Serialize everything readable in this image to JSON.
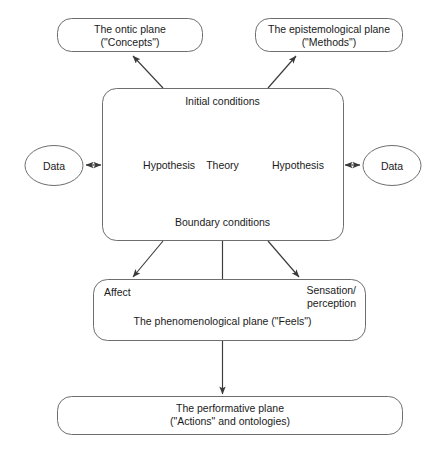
{
  "diagram": {
    "style": {
      "node_fill": "#ffffff",
      "node_stroke": "#6e6e6e",
      "edge_stroke": "#3a3a3a",
      "text_color": "#1a1a1a",
      "background": "#ffffff"
    },
    "nodes": {
      "ontic_plane": {
        "line1": "The ontic plane",
        "line2": "(\"Concepts\")"
      },
      "epistemological_plane": {
        "line1": "The epistemological plane",
        "line2": "(\"Methods\")"
      },
      "initial_conditions": {
        "label": "Initial conditions"
      },
      "boundary_conditions": {
        "label": "Boundary conditions"
      },
      "theory": {
        "label": "Theory"
      },
      "hypothesis_left": {
        "label": "Hypothesis"
      },
      "hypothesis_right": {
        "label": "Hypothesis"
      },
      "data_left": {
        "label": "Data"
      },
      "data_right": {
        "label": "Data"
      },
      "affect": {
        "label": "Affect"
      },
      "sensation_perception": {
        "line1": "Sensation/",
        "line2": "perception"
      },
      "phenomenological_plane": {
        "label": "The phenomenological plane (\"Feels\")"
      },
      "performative_plane": {
        "line1": "The performative plane",
        "line2": "(\"Actions\" and ontologies)"
      }
    },
    "edges": [
      {
        "name": "main-box-to-ontic-plane",
        "from": "main_box_top_left",
        "to": "ontic_plane",
        "arrow": "single"
      },
      {
        "name": "main-box-to-epistemological-plane",
        "from": "main_box_top_right",
        "to": "epistemological_plane",
        "arrow": "single"
      },
      {
        "name": "initial-conditions-to-theory",
        "from": "initial_conditions",
        "to": "theory",
        "arrow": "single"
      },
      {
        "name": "boundary-conditions-to-theory",
        "from": "boundary_conditions",
        "to": "theory",
        "arrow": "single"
      },
      {
        "name": "theory-to-hypothesis-left",
        "from": "theory",
        "to": "hypothesis_left",
        "arrow": "single"
      },
      {
        "name": "theory-to-hypothesis-right",
        "from": "theory",
        "to": "hypothesis_right",
        "arrow": "single"
      },
      {
        "name": "data-left-to-hypothesis-left",
        "from": "data_left",
        "to": "hypothesis_left",
        "arrow": "double"
      },
      {
        "name": "data-right-to-hypothesis-right",
        "from": "hypothesis_right",
        "to": "data_right",
        "arrow": "double"
      },
      {
        "name": "main-box-to-affect",
        "from": "main_box_bottom_left",
        "to": "affect",
        "arrow": "single"
      },
      {
        "name": "main-box-to-phenomenological-plane",
        "from": "main_box_bottom_center",
        "to": "phenomenological_plane",
        "arrow": "none"
      },
      {
        "name": "main-box-to-sensation-perception",
        "from": "main_box_bottom_right",
        "to": "sensation_perception",
        "arrow": "single"
      },
      {
        "name": "phenomenological-plane-to-performative-plane",
        "from": "phenomenological_plane",
        "to": "performative_plane",
        "arrow": "single"
      }
    ]
  }
}
